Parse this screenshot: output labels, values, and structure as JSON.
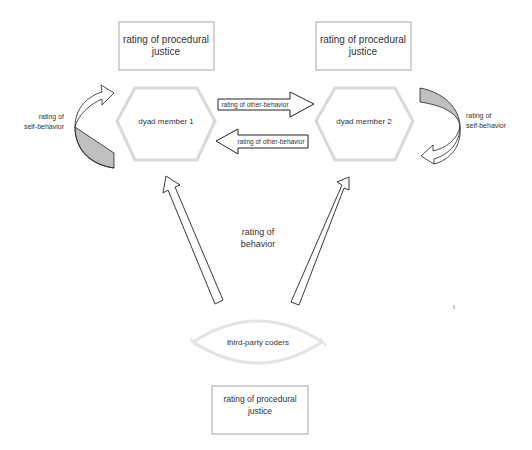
{
  "diagram": {
    "boxes": {
      "procedural_justice_1": "rating of procedural justice",
      "procedural_justice_2": "rating of procedural justice",
      "procedural_justice_3": "rating of procedural justice"
    },
    "box_lines": {
      "line1": "rating of procedural",
      "line2": "justice"
    },
    "nodes": {
      "member1": "dyad member 1",
      "member2": "dyad member 2",
      "coders": "third-party coders"
    },
    "arrows": {
      "other_behavior_right": "rating of other-behavior",
      "other_behavior_left": "rating of other-behavior",
      "behavior_line1": "rating of",
      "behavior_line2": "behavior",
      "self_left_line1": "rating of",
      "self_left_line2": "self-behavior",
      "self_right_line1": "rating of",
      "self_right_line2": "self-behavior"
    },
    "colors": {
      "node_outline": "#d9d9d9",
      "box_outline": "#a6a6a6",
      "arrow_stroke": "#222222",
      "curved_arrow_fill": "#bfbfbf"
    }
  }
}
